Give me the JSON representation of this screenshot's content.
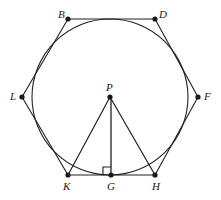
{
  "figure": {
    "width": 221,
    "height": 200,
    "background_color": "#ffffff",
    "stroke_color": "#231f20",
    "point_color": "#1a1a1a",
    "label_color": "#1a1a1a"
  },
  "circle": {
    "name": "circle-P",
    "center_label": "P",
    "cx": 110,
    "cy": 97,
    "r": 78,
    "stroke": "#231f20",
    "stroke_width": 1.1,
    "fill": "none"
  },
  "points": {
    "B": {
      "label": "B",
      "x": 68,
      "y": 19,
      "label_x": 58,
      "label_y": 9
    },
    "D": {
      "label": "D",
      "x": 155,
      "y": 19,
      "label_x": 159,
      "label_y": 9
    },
    "F": {
      "label": "F",
      "x": 198,
      "y": 97,
      "label_x": 204,
      "label_y": 91
    },
    "H": {
      "label": "H",
      "x": 155,
      "y": 175,
      "label_x": 152,
      "label_y": 181
    },
    "G": {
      "label": "G",
      "x": 112,
      "y": 175,
      "label_x": 107,
      "label_y": 181
    },
    "K": {
      "label": "K",
      "x": 68,
      "y": 175,
      "label_x": 63,
      "label_y": 181
    },
    "L": {
      "label": "L",
      "x": 22,
      "y": 97,
      "label_x": 10,
      "label_y": 91
    },
    "P": {
      "label": "P",
      "x": 110,
      "y": 97,
      "label_x": 106,
      "label_y": 82
    }
  },
  "polygon": {
    "name": "hexagon-BDFHKL",
    "vertex_order": [
      "B",
      "D",
      "F",
      "H",
      "K",
      "L"
    ],
    "points_attr": "68,19 155,19 198,97 155,175 68,175 22,97",
    "stroke": "#231f20",
    "stroke_width": 1.1,
    "fill": "none"
  },
  "triangle": {
    "name": "triangle-PKH",
    "vertex_order": [
      "P",
      "K",
      "H"
    ],
    "segments": [
      {
        "name": "segment-PK",
        "from": "P",
        "to": "K",
        "x1": 110,
        "y1": 97,
        "x2": 68,
        "y2": 175
      },
      {
        "name": "segment-PH",
        "from": "P",
        "to": "H",
        "x1": 110,
        "y1": 97,
        "x2": 155,
        "y2": 175
      },
      {
        "name": "segment-PG",
        "from": "P",
        "to": "G",
        "x1": 111,
        "y1": 97,
        "x2": 111,
        "y2": 175
      }
    ],
    "stroke": "#231f20",
    "stroke_width": 1.2
  },
  "right_angle_marker": {
    "name": "right-angle-marker-G",
    "at_point": "G",
    "size": 8,
    "path": "M 103,175 L 103,167 L 111,167",
    "stroke": "#231f20",
    "stroke_width": 1.1,
    "fill": "none"
  },
  "point_markers": {
    "radius": 2.6,
    "fill": "#1a1a1a"
  }
}
